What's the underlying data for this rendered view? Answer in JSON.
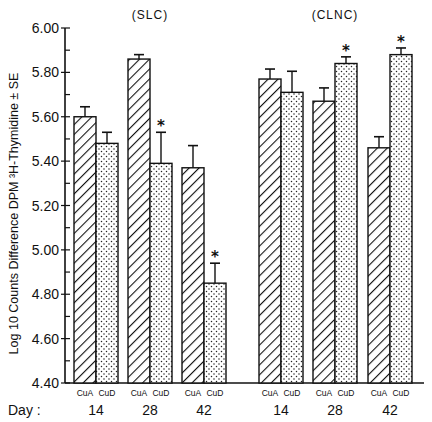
{
  "chart_data": {
    "type": "bar",
    "title": "",
    "ylabel": "Log 10 Counts Difference DPM ³H-Thymidine ± SE",
    "xlabel": "Day",
    "ylim": [
      4.4,
      6.0
    ],
    "yticks": [
      "4.40",
      "4.60",
      "4.80",
      "5.00",
      "5.20",
      "5.40",
      "5.60",
      "5.80",
      "6.00"
    ],
    "minor_tick_step": 0.1,
    "grid": false,
    "legend": "none (series identified by per-bar labels CuA / CuD; CuA = diagonal hatch, CuD = dotted)",
    "groups": [
      {
        "name": "(SLC)",
        "categories": [
          "14",
          "28",
          "42"
        ],
        "series": [
          {
            "name": "CuA",
            "pattern": "hatch",
            "values": [
              5.6,
              5.86,
              5.37
            ],
            "se": [
              0.045,
              0.02,
              0.1
            ],
            "significant": [
              false,
              false,
              false
            ]
          },
          {
            "name": "CuD",
            "pattern": "dots",
            "values": [
              5.48,
              5.39,
              4.85
            ],
            "se": [
              0.05,
              0.14,
              0.09
            ],
            "significant": [
              false,
              true,
              true
            ]
          }
        ]
      },
      {
        "name": "(CLNC)",
        "categories": [
          "14",
          "28",
          "42"
        ],
        "series": [
          {
            "name": "CuA",
            "pattern": "hatch",
            "values": [
              5.77,
              5.67,
              5.46
            ],
            "se": [
              0.045,
              0.06,
              0.05
            ],
            "significant": [
              false,
              false,
              false
            ]
          },
          {
            "name": "CuD",
            "pattern": "dots",
            "values": [
              5.71,
              5.84,
              5.88
            ],
            "se": [
              0.095,
              0.03,
              0.03
            ],
            "significant": [
              false,
              true,
              true
            ]
          }
        ]
      }
    ],
    "annotations": [
      "* marks significant difference (above CuD bars at SLC day 28, SLC day 42, CLNC day 28, CLNC day 42)"
    ]
  },
  "labels": {
    "day_prefix": "Day :",
    "cua": "CuA",
    "cud": "CuD",
    "star": "*"
  }
}
